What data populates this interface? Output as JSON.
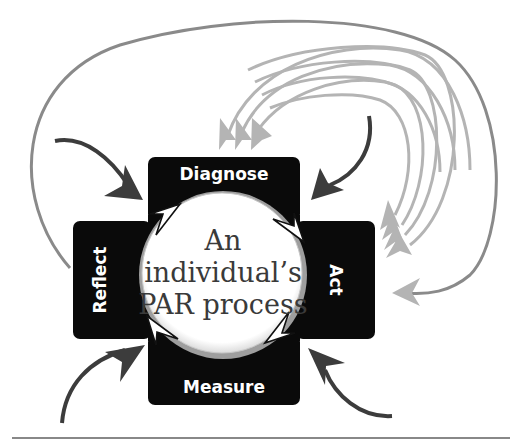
{
  "diagram": {
    "title_lines": [
      "An",
      "individual’s",
      "PAR process"
    ],
    "stages": [
      {
        "id": "diagnose",
        "label": "Diagnose",
        "position": "top"
      },
      {
        "id": "act",
        "label": "Act",
        "position": "right"
      },
      {
        "id": "measure",
        "label": "Measure",
        "position": "bottom"
      },
      {
        "id": "reflect",
        "label": "Reflect",
        "position": "left"
      }
    ],
    "colors": {
      "box_fill": "#0a0a0a",
      "box_text": "#ffffff",
      "circle_fill": "#ffffff",
      "circle_rim": "#a8a8a8",
      "center_text": "#3a3a3a",
      "input_arrow": "#3c3c3c",
      "feedback_arrow": "#b4b4b4",
      "outer_loop": "#8a8a8a",
      "cycle_arrow_fill": "#ffffff",
      "cycle_arrow_stroke": "#111111"
    },
    "arrows": {
      "external_inputs": 4,
      "feedback_arcs_to_diagnose": 3,
      "feedback_arcs_to_act": 4,
      "outer_loop_from": "reflect",
      "outer_loop_to": "act",
      "cycle_direction": "clockwise"
    }
  }
}
